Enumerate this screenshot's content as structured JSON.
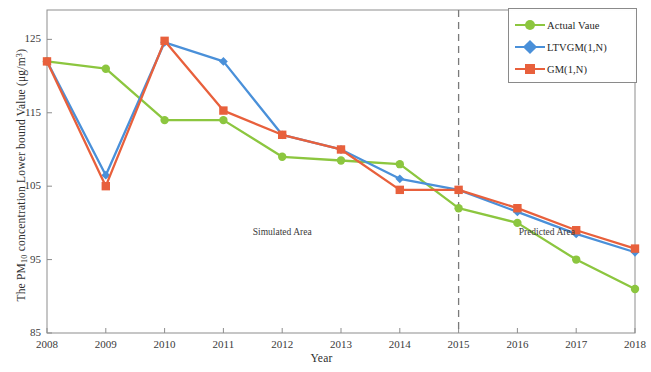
{
  "chart_data": {
    "type": "line",
    "title": "",
    "xlabel": "Year",
    "ylabel": "The PM10 concentration Lower bound Value (μg/m3)",
    "ylabel_main": "The PM",
    "ylabel_sub": "10",
    "ylabel_rest": " concentration Lower bound Value (μg/m",
    "ylabel_sup": "3",
    "ylabel_close": ")",
    "categories": [
      "2008",
      "2009",
      "2010",
      "2011",
      "2012",
      "2013",
      "2014",
      "2015",
      "2016",
      "2017",
      "2018"
    ],
    "x": [
      2008,
      2009,
      2010,
      2011,
      2012,
      2013,
      2014,
      2015,
      2016,
      2017,
      2018
    ],
    "ylim": [
      85,
      129
    ],
    "xlim": [
      2008,
      2018
    ],
    "yticks": [
      "85",
      "95",
      "105",
      "115",
      "125"
    ],
    "ytick_values": [
      85,
      95,
      105,
      115,
      125
    ],
    "grid": false,
    "legend_position": "top-right",
    "series": [
      {
        "name": "Actual Vaue",
        "color": "#8cc63f",
        "marker": "circle",
        "values": [
          122.0,
          121.0,
          114.0,
          114.0,
          109.0,
          108.5,
          108.0,
          102.0,
          100.0,
          95.0,
          91.0
        ]
      },
      {
        "name": "LTVGM(1,N)",
        "color": "#4a90d9",
        "marker": "diamond",
        "values": [
          122.0,
          106.5,
          124.6,
          122.0,
          112.0,
          110.0,
          106.0,
          104.5,
          101.5,
          98.5,
          96.0
        ]
      },
      {
        "name": "GM(1,N)",
        "color": "#e8603c",
        "marker": "square",
        "values": [
          122.0,
          105.0,
          124.8,
          115.3,
          112.0,
          110.0,
          104.5,
          104.5,
          102.0,
          99.0,
          96.5
        ]
      }
    ],
    "annotations": [
      {
        "text": "Simulated  Area",
        "x": 2012,
        "y": 98.5
      },
      {
        "text": "Predicted  Area",
        "x": 2016.5,
        "y": 98.5
      }
    ],
    "divider": {
      "x": 2015,
      "style": "dashed",
      "color": "#7a7a7a"
    }
  },
  "legend": {
    "items": [
      {
        "label": "Actual Vaue"
      },
      {
        "label": "LTVGM(1,N)"
      },
      {
        "label": "GM(1,N)"
      }
    ]
  }
}
